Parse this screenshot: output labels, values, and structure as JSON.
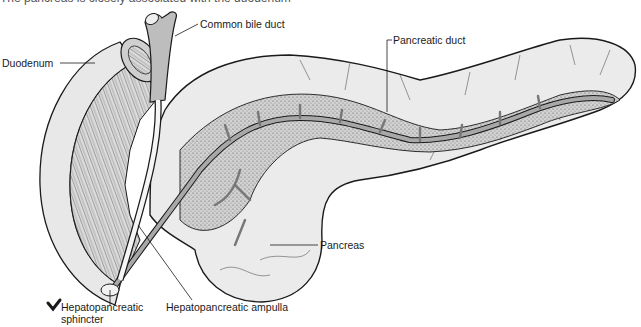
{
  "caption_partial": "The pancreas is closely associated with the duodenum",
  "labels": {
    "common_bile_duct": "Common bile duct",
    "duodenum": "Duodenum",
    "pancreatic_duct": "Pancreatic duct",
    "pancreas": "Pancreas",
    "hepatopancreatic_ampulla": "Hepatopancreatic ampulla",
    "hepatopancreatic_sphincter_line1": "Hepatopancreatic",
    "hepatopancreatic_sphincter_line2": "sphincter"
  },
  "colors": {
    "outline": "#1a1a1a",
    "tissue_light": "#e6e6e6",
    "tissue_stipple": "#b8b8b8",
    "duct": "#9a9a9a",
    "background": "#ffffff"
  }
}
